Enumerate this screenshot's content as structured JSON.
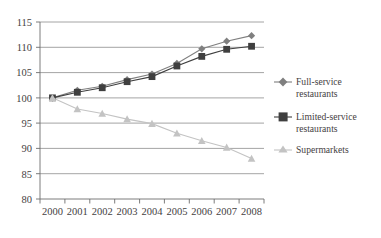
{
  "chart_data": {
    "type": "line",
    "title": "",
    "subtitle": "",
    "xlabel": "",
    "ylabel": "",
    "categories": [
      "2000",
      "2001",
      "2002",
      "2003",
      "2004",
      "2005",
      "2006",
      "2007",
      "2008"
    ],
    "ylim": [
      80,
      115
    ],
    "yticks": [
      80,
      85,
      90,
      95,
      100,
      105,
      110,
      115
    ],
    "grid": true,
    "legend_position": "right",
    "series": [
      {
        "name": "Full-service restaurants",
        "marker": "diamond",
        "color": "#7f7f7f",
        "values": [
          100,
          101.5,
          102.3,
          103.6,
          104.7,
          106.8,
          109.7,
          111.2,
          112.3
        ]
      },
      {
        "name": "Limited-service restaurants",
        "marker": "square",
        "color": "#3f3f3f",
        "values": [
          100,
          101.1,
          102.0,
          103.2,
          104.2,
          106.3,
          108.2,
          109.6,
          110.2
        ]
      },
      {
        "name": "Supermarkets",
        "marker": "triangle",
        "color": "#c3c3c3",
        "values": [
          100,
          97.8,
          96.9,
          95.8,
          94.9,
          93.0,
          91.5,
          90.2,
          88.0
        ]
      }
    ]
  },
  "legend": {
    "items": [
      {
        "label_line1": "Full-service",
        "label_line2": "restaurants"
      },
      {
        "label_line1": "Limited-service",
        "label_line2": "restaurants"
      },
      {
        "label_line1": "Supermarkets",
        "label_line2": ""
      }
    ]
  },
  "axes": {
    "y_tick_labels": [
      "115",
      "110",
      "105",
      "100",
      "95",
      "90",
      "85",
      "80"
    ],
    "x_tick_labels": [
      "2000",
      "2001",
      "2002",
      "2003",
      "2004",
      "2005",
      "2006",
      "2007",
      "2008"
    ]
  },
  "colors": {
    "full_service": "#7f7f7f",
    "limited_service": "#3f3f3f",
    "supermarkets": "#c3c3c3",
    "grid": "#8d8d8d",
    "axis": "#6d6d6d",
    "text": "#45413f",
    "background": "#ffffff"
  }
}
